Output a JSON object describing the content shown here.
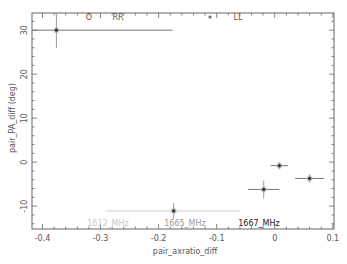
{
  "chart_data": {
    "type": "scatter",
    "title": "",
    "xlabel": "pair_axratio_diff",
    "ylabel": "pair_PA_diff (deg)",
    "xlim": [
      -0.418,
      0.102
    ],
    "ylim": [
      -15.2,
      33.9
    ],
    "x_ticks": [
      -0.4,
      -0.3,
      -0.2,
      -0.1,
      0,
      0.1
    ],
    "x_tick_labels": [
      "-0.4",
      "-0.3",
      "-0.2",
      "-0.1",
      "0",
      "0.1"
    ],
    "y_ticks": [
      -10,
      0,
      10,
      20,
      30
    ],
    "y_tick_labels": [
      "-10",
      "0",
      "10",
      "20",
      "30"
    ],
    "grid": false,
    "series": [
      {
        "name": "1612_MHz",
        "color": "#c8c8c8",
        "points": []
      },
      {
        "name": "1665_MHz",
        "color": "#999999",
        "points": [
          {
            "x": -0.174,
            "y": -11.1,
            "xerr": 0.115,
            "yerr": 1.8
          }
        ]
      },
      {
        "name": "1667_MHz",
        "color": "#333333",
        "points": [
          {
            "x": 0.008,
            "y": -0.8,
            "xerr": 0.015,
            "yerr": 0.8
          },
          {
            "x": 0.06,
            "y": -3.7,
            "xerr": 0.025,
            "yerr": 1.0
          },
          {
            "x": -0.019,
            "y": -6.2,
            "xerr": 0.027,
            "yerr": 2.0
          },
          {
            "x": -0.376,
            "y": 30.0,
            "xerr": 0.2,
            "yerr": 4.0
          }
        ]
      }
    ],
    "legend": {
      "position": "bottom-inside",
      "entries": [
        "1612_MHz",
        "1665_MHz",
        "1667_MHz"
      ]
    },
    "annotations": [
      {
        "symbol": "O",
        "text": "RR",
        "position": "top"
      },
      {
        "symbol": "*",
        "text": "LL",
        "position": "top"
      }
    ]
  },
  "labels": {
    "xlabel": "pair_axratio_diff",
    "ylabel": "pair_PA_diff (deg)",
    "legend_1612": "1612_MHz",
    "legend_1665": "1665_MHz",
    "legend_1667": "1667_MHz",
    "rr_symbol": "O",
    "rr_text": "RR",
    "ll_symbol": "*",
    "ll_text": "LL"
  }
}
